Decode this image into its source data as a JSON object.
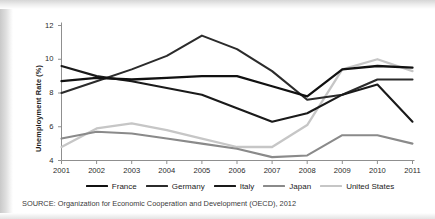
{
  "chart_data": {
    "type": "line",
    "title": "",
    "xlabel": "",
    "ylabel": "Unemployment Rate (%)",
    "x": [
      2001,
      2002,
      2003,
      2004,
      2005,
      2006,
      2007,
      2008,
      2009,
      2010,
      2011
    ],
    "categories": [
      "2001",
      "2002",
      "2003",
      "2004",
      "2005",
      "2006",
      "2007",
      "2008",
      "2009",
      "2010",
      "2011"
    ],
    "xlim": [
      2001,
      2011
    ],
    "ylim": [
      4,
      12
    ],
    "yticks": [
      4,
      6,
      8,
      10,
      12
    ],
    "ytick_labels": [
      "4",
      "6",
      "8",
      "10",
      "12"
    ],
    "grid": false,
    "legend_position": "bottom",
    "series": [
      {
        "name": "France",
        "color": "#111111",
        "width": 2.3,
        "values": [
          8.7,
          8.9,
          8.8,
          8.9,
          9.0,
          9.0,
          8.4,
          7.8,
          9.4,
          9.6,
          9.5
        ]
      },
      {
        "name": "Germany",
        "color": "#2b2b2b",
        "width": 2.1,
        "values": [
          8.0,
          8.7,
          9.4,
          10.2,
          11.4,
          10.6,
          9.3,
          7.6,
          7.9,
          8.8,
          8.8
        ]
      },
      {
        "name": "Italy",
        "color": "#1a1a1a",
        "width": 2.1,
        "values": [
          9.6,
          9.0,
          8.7,
          8.3,
          7.9,
          7.1,
          6.3,
          6.8,
          7.9,
          8.5,
          6.3
        ]
      },
      {
        "name": "Japan",
        "color": "#8a8a8a",
        "width": 2.1,
        "values": [
          5.3,
          5.7,
          5.6,
          5.3,
          5.0,
          4.7,
          4.2,
          4.3,
          5.5,
          5.5,
          5.0
        ]
      },
      {
        "name": "United States",
        "color": "#c6c6c6",
        "width": 2.3,
        "values": [
          4.8,
          5.9,
          6.2,
          5.8,
          5.3,
          4.8,
          4.8,
          6.1,
          9.4,
          10.0,
          9.3
        ]
      }
    ]
  },
  "source": {
    "text": "SOURCE: Organization for Economic Cooperation and Development (OECD), 2012"
  }
}
